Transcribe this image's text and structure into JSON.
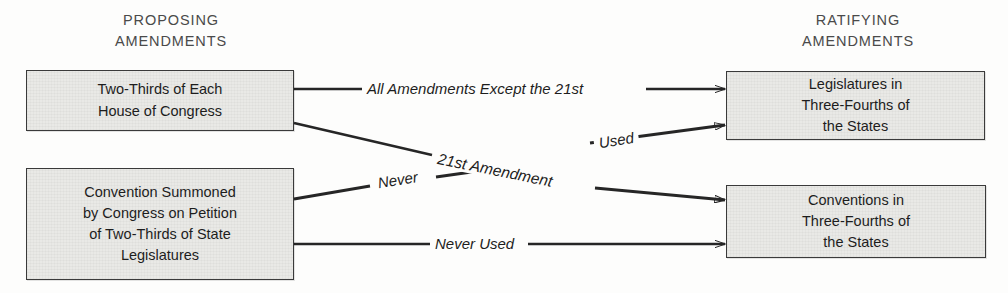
{
  "diagram": {
    "background_color": "#fdfdfc",
    "box_fill_color": "#e9e9e6",
    "box_border_color": "#3a3a3a",
    "line_color": "#262626"
  },
  "headings": {
    "left": "PROPOSING\nAMENDMENTS",
    "right": "RATIFYING\nAMENDMENTS"
  },
  "nodes": {
    "proposing": [
      {
        "id": "two-thirds-congress",
        "text": "Two-Thirds of Each\nHouse of Congress"
      },
      {
        "id": "convention-summoned",
        "text": "Convention Summoned\nby Congress on Petition\nof Two-Thirds of State\nLegislatures"
      }
    ],
    "ratifying": [
      {
        "id": "legislatures",
        "text": "Legislatures in\nThree-Fourths of\nthe States"
      },
      {
        "id": "conventions",
        "text": "Conventions in\nThree-Fourths of\nthe States"
      }
    ]
  },
  "edges": [
    {
      "id": "congress-to-legislatures",
      "label": "All Amendments Except the 21st",
      "from": "two-thirds-congress",
      "to": "legislatures"
    },
    {
      "id": "congress-to-conventions",
      "label": "21st Amendment",
      "secondary_label": "Used",
      "from": "two-thirds-congress",
      "to": "conventions"
    },
    {
      "id": "convention-to-legislatures",
      "label": "Never",
      "from": "convention-summoned",
      "to": "legislatures"
    },
    {
      "id": "convention-to-conventions",
      "label": "Never Used",
      "from": "convention-summoned",
      "to": "conventions"
    }
  ],
  "edge_labels": {
    "all_amendments": "All Amendments Except the 21st",
    "twenty_first_amendment": "21st Amendment",
    "never": "Never",
    "used": "Used",
    "never_used": "Never Used"
  }
}
